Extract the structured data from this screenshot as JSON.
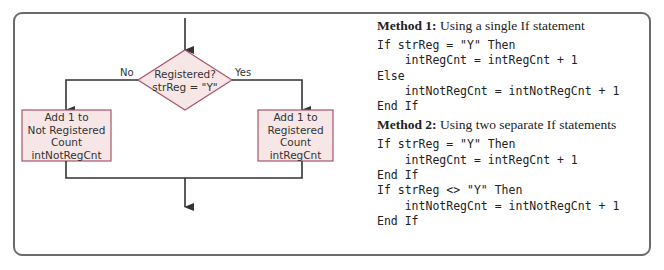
{
  "flowchart": {
    "decision": {
      "line1": "Registered?",
      "line2": "strReg = \"Y\""
    },
    "branch_no_label": "No",
    "branch_yes_label": "Yes",
    "left_process": {
      "line1": "Add 1 to",
      "line2": "Not Registered",
      "line3": "Count",
      "line4": "intNotRegCnt"
    },
    "right_process": {
      "line1": "Add 1 to",
      "line2": "Registered",
      "line3": "Count",
      "line4": "intRegCnt"
    },
    "colors": {
      "shape_fill": "#f6e6e6",
      "shape_stroke": "#a8546a",
      "line": "#333333",
      "frame": "#6b6b6b"
    }
  },
  "method1": {
    "heading_bold": "Method 1:",
    "heading_rest": " Using a single If statement",
    "code": [
      "If strReg = \"Y\" Then",
      "    intRegCnt = intRegCnt + 1",
      "Else",
      "    intNotRegCnt = intNotRegCnt + 1",
      "End If"
    ]
  },
  "method2": {
    "heading_bold": "Method 2:",
    "heading_rest": " Using two separate If statements",
    "code": [
      "If strReg = \"Y\" Then",
      "    intRegCnt = intRegCnt + 1",
      "End If",
      "If strReg <> \"Y\" Then",
      "    intNotRegCnt = intNotRegCnt + 1",
      "End If"
    ]
  }
}
